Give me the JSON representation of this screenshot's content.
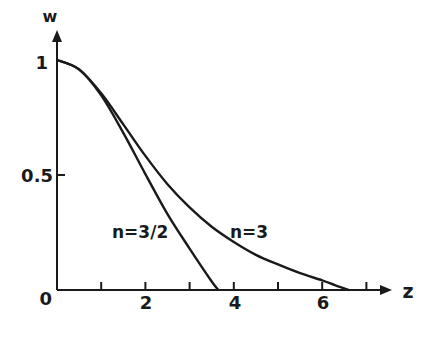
{
  "chart_data": {
    "type": "line",
    "title": "",
    "xlabel": "z",
    "ylabel": "w",
    "xlim": [
      0,
      7.3
    ],
    "ylim": [
      0,
      1.1
    ],
    "x_ticks": [
      0,
      1,
      2,
      3,
      4,
      5,
      6,
      7
    ],
    "x_tick_labels": [
      "0",
      "",
      "2",
      "",
      "4",
      "",
      "6",
      ""
    ],
    "y_ticks": [
      0,
      0.5,
      1
    ],
    "y_tick_labels": [
      "0",
      "0.5",
      "1"
    ],
    "grid": false,
    "legend": "inline labels",
    "series": [
      {
        "name": "n=3/2",
        "x": [
          0,
          0.5,
          1.0,
          1.5,
          2.0,
          2.5,
          3.0,
          3.5,
          3.654
        ],
        "y": [
          1.0,
          0.959,
          0.846,
          0.683,
          0.504,
          0.33,
          0.18,
          0.037,
          0.0
        ]
      },
      {
        "name": "n=3",
        "x": [
          0,
          0.5,
          1.0,
          1.5,
          2.0,
          2.5,
          3.0,
          3.5,
          4.0,
          4.5,
          5.0,
          5.5,
          6.0,
          6.3,
          6.6
        ],
        "y": [
          1.0,
          0.959,
          0.855,
          0.72,
          0.583,
          0.46,
          0.359,
          0.275,
          0.209,
          0.153,
          0.111,
          0.073,
          0.042,
          0.02,
          0.0
        ]
      }
    ],
    "annotations": [
      {
        "text": "n=3/2",
        "x": 1.55,
        "y": 0.25
      },
      {
        "text": "n=3",
        "x": 4.05,
        "y": 0.25
      }
    ]
  },
  "labels": {
    "y_axis": "w",
    "x_axis": "z",
    "y_one": "1",
    "y_half": "0.5",
    "origin": "0",
    "x2": "2",
    "x4": "4",
    "x6": "6",
    "n32": "n=3/2",
    "n3": "n=3"
  }
}
